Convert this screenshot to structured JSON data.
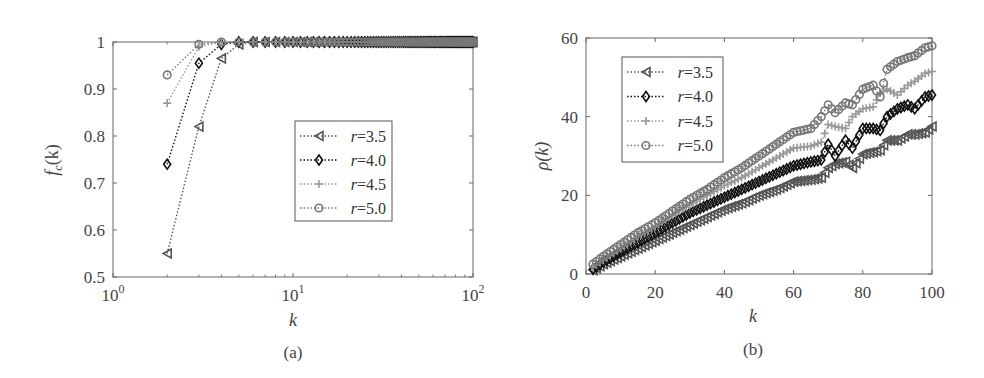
{
  "chart_data": [
    {
      "id": "a",
      "type": "line",
      "caption": "(a)",
      "xlabel": "k",
      "ylabel": "f_c(k)",
      "ylabel_main": "f",
      "ylabel_sub": "c",
      "ylabel_arg": "(k)",
      "xscale": "log",
      "xlim": [
        1,
        100
      ],
      "ylim": [
        0.5,
        1
      ],
      "xticks": [
        1,
        10,
        100
      ],
      "xtick_labels": [
        {
          "base": "10",
          "exp": "0"
        },
        {
          "base": "10",
          "exp": "1"
        },
        {
          "base": "10",
          "exp": "2"
        }
      ],
      "yticks": [
        0.5,
        0.6,
        0.7,
        0.8,
        0.9,
        1
      ],
      "ytick_labels": [
        "0.5",
        "0.6",
        "0.7",
        "0.8",
        "0.9",
        "1"
      ],
      "grid": false,
      "legend_position": "center-right",
      "series": [
        {
          "name": "r=3.5",
          "label_r": "r",
          "label_val": "3.5",
          "marker": "triangle-left",
          "color": "#555555",
          "x": [
            2,
            3,
            4,
            5,
            6,
            7,
            8,
            9,
            10,
            12,
            15,
            20,
            30,
            50,
            100
          ],
          "values": [
            0.55,
            0.82,
            0.965,
            0.995,
            1,
            1,
            1,
            1,
            1,
            1,
            1,
            1,
            1,
            1,
            1
          ]
        },
        {
          "name": "r=4.0",
          "label_r": "r",
          "label_val": "4.0",
          "marker": "diamond",
          "color": "#111111",
          "x": [
            2,
            3,
            4,
            5,
            6,
            7,
            8,
            9,
            10,
            12,
            15,
            20,
            30,
            50,
            100
          ],
          "values": [
            0.74,
            0.955,
            0.995,
            1,
            1,
            1,
            1,
            1,
            1,
            1,
            1,
            1,
            1,
            1,
            1
          ]
        },
        {
          "name": "r=4.5",
          "label_r": "r",
          "label_val": "4.5",
          "marker": "plus",
          "color": "#999999",
          "x": [
            2,
            3,
            4,
            5,
            6,
            7,
            8,
            9,
            10,
            12,
            15,
            20,
            30,
            50,
            100
          ],
          "values": [
            0.87,
            0.99,
            1,
            1,
            1,
            1,
            1,
            1,
            1,
            1,
            1,
            1,
            1,
            1,
            1
          ]
        },
        {
          "name": "r=5.0",
          "label_r": "r",
          "label_val": "5.0",
          "marker": "circle",
          "color": "#777777",
          "x": [
            2,
            3,
            4,
            5,
            6,
            7,
            8,
            9,
            10,
            12,
            15,
            20,
            30,
            50,
            100
          ],
          "values": [
            0.93,
            0.995,
            1,
            1,
            1,
            1,
            1,
            1,
            1,
            1,
            1,
            1,
            1,
            1,
            1
          ]
        }
      ]
    },
    {
      "id": "b",
      "type": "line",
      "caption": "(b)",
      "xlabel": "k",
      "ylabel": "ρ(k)",
      "xlim": [
        0,
        100
      ],
      "ylim": [
        0,
        60
      ],
      "xticks": [
        0,
        20,
        40,
        60,
        80,
        100
      ],
      "xtick_labels": [
        "0",
        "20",
        "40",
        "60",
        "80",
        "100"
      ],
      "yticks": [
        0,
        20,
        40,
        60
      ],
      "ytick_labels": [
        "0",
        "20",
        "40",
        "60"
      ],
      "grid": false,
      "legend_position": "upper-left",
      "series": [
        {
          "name": "r=3.5",
          "label_r": "r",
          "label_val": "3.5",
          "marker": "triangle-left",
          "color": "#555555",
          "x": [
            2,
            5,
            10,
            15,
            20,
            25,
            30,
            35,
            40,
            45,
            50,
            55,
            60,
            65,
            68,
            70,
            72,
            75,
            77,
            80,
            83,
            85,
            87,
            90,
            93,
            95,
            98,
            100
          ],
          "values": [
            1,
            2.5,
            4.5,
            6.5,
            8.5,
            10.5,
            12.5,
            14.5,
            16.5,
            18,
            20,
            21.5,
            23.5,
            24,
            24.5,
            27,
            28,
            28.5,
            27,
            30.5,
            31,
            31.5,
            34,
            34,
            35.5,
            35.5,
            36,
            37.5
          ]
        },
        {
          "name": "r=4.0",
          "label_r": "r",
          "label_val": "4.0",
          "marker": "diamond",
          "color": "#111111",
          "x": [
            2,
            5,
            10,
            15,
            20,
            25,
            30,
            35,
            40,
            45,
            50,
            55,
            60,
            65,
            68,
            70,
            72,
            75,
            77,
            80,
            83,
            85,
            87,
            90,
            93,
            95,
            98,
            100
          ],
          "values": [
            1.2,
            3,
            5.5,
            8,
            10.5,
            13,
            15.5,
            17.5,
            19.5,
            21.5,
            23.5,
            25.5,
            27.5,
            28.5,
            29,
            33,
            30,
            34,
            32,
            37,
            37,
            36.5,
            40,
            42,
            43,
            42,
            45,
            45.5
          ]
        },
        {
          "name": "r=4.5",
          "label_r": "r",
          "label_val": "4.5",
          "marker": "plus",
          "color": "#999999",
          "x": [
            2,
            5,
            10,
            15,
            20,
            25,
            30,
            35,
            40,
            45,
            50,
            55,
            60,
            65,
            68,
            70,
            72,
            75,
            77,
            80,
            83,
            85,
            87,
            90,
            93,
            95,
            98,
            100
          ],
          "values": [
            1.8,
            3.5,
            6.5,
            9.5,
            12,
            15,
            17.5,
            20,
            22.5,
            24.5,
            27,
            29.5,
            32,
            32.5,
            33.5,
            38,
            37.5,
            37,
            40,
            42,
            42.5,
            46,
            47,
            45.5,
            48,
            49,
            51,
            51.5
          ]
        },
        {
          "name": "r=5.0",
          "label_r": "r",
          "label_val": "5.0",
          "marker": "circle",
          "color": "#777777",
          "x": [
            2,
            5,
            10,
            15,
            20,
            25,
            30,
            35,
            40,
            45,
            50,
            55,
            60,
            65,
            68,
            70,
            72,
            75,
            77,
            80,
            83,
            85,
            87,
            90,
            93,
            95,
            98,
            100
          ],
          "values": [
            2.5,
            4.5,
            7.5,
            10.5,
            13,
            16,
            19,
            21.5,
            24.5,
            27,
            30,
            33,
            36,
            37,
            40,
            43,
            41,
            43.5,
            43,
            47,
            48,
            45,
            52,
            54,
            55,
            55.5,
            57.5,
            58
          ]
        }
      ]
    }
  ]
}
